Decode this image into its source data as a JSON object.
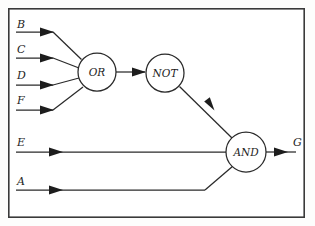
{
  "diagram": {
    "frame": {
      "x": 8,
      "y": 8,
      "width": 297,
      "height": 210
    },
    "colors": {
      "background": "#fdfdfc",
      "frame_stroke": "#3a3a3a",
      "wire_stroke": "#2a2a2a",
      "label_fill": "#1d1d1d",
      "gate_fill": "#ffffff"
    },
    "gates": [
      {
        "id": "or-gate",
        "label": "OR",
        "cx": 97,
        "cy": 72,
        "r": 19
      },
      {
        "id": "not-gate",
        "label": "NOT",
        "cx": 165,
        "cy": 73,
        "r": 19
      },
      {
        "id": "and-gate",
        "label": "AND",
        "cx": 246,
        "cy": 152,
        "r": 20
      }
    ],
    "inputs": [
      {
        "id": "input-b",
        "label": "B",
        "label_x": 17,
        "label_y": 28,
        "line_y": 32
      },
      {
        "id": "input-c",
        "label": "C",
        "label_x": 17,
        "label_y": 53,
        "line_y": 58
      },
      {
        "id": "input-d",
        "label": "D",
        "label_x": 17,
        "label_y": 79,
        "line_y": 85
      },
      {
        "id": "input-f",
        "label": "F",
        "label_x": 17,
        "label_y": 104,
        "line_y": 110
      },
      {
        "id": "input-e",
        "label": "E",
        "label_x": 17,
        "label_y": 146,
        "line_y": 152
      },
      {
        "id": "input-a",
        "label": "A",
        "label_x": 17,
        "label_y": 185,
        "line_y": 190
      }
    ],
    "outputs": [
      {
        "id": "output-g",
        "label": "G",
        "label_x": 293,
        "label_y": 146,
        "line_y": 152
      }
    ],
    "connections": [
      {
        "id": "wire-b-or",
        "from": "B",
        "to": "OR"
      },
      {
        "id": "wire-c-or",
        "from": "C",
        "to": "OR"
      },
      {
        "id": "wire-d-or",
        "from": "D",
        "to": "OR"
      },
      {
        "id": "wire-f-or",
        "from": "F",
        "to": "OR"
      },
      {
        "id": "wire-or-not",
        "from": "OR",
        "to": "NOT"
      },
      {
        "id": "wire-not-and",
        "from": "NOT",
        "to": "AND"
      },
      {
        "id": "wire-e-and",
        "from": "E",
        "to": "AND"
      },
      {
        "id": "wire-a-and",
        "from": "A",
        "to": "AND"
      },
      {
        "id": "wire-and-g",
        "from": "AND",
        "to": "G"
      }
    ]
  }
}
